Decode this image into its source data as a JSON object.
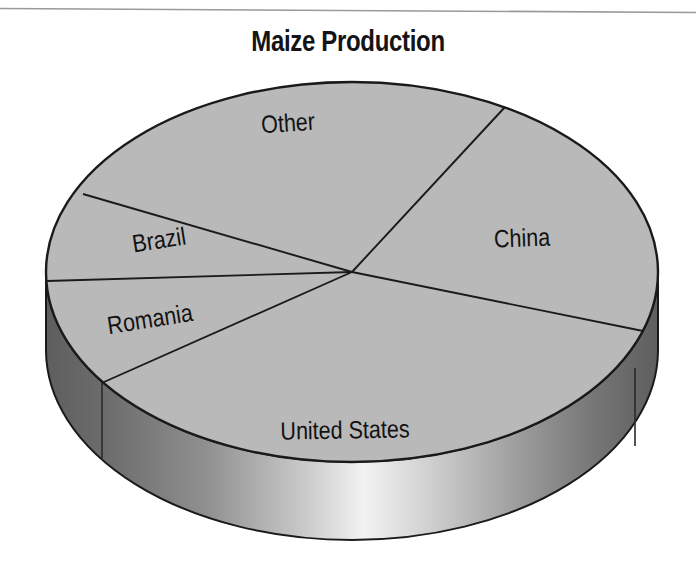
{
  "figure": {
    "title": "Maize Production",
    "background_color": "#ffffff"
  },
  "colors": {
    "top_face": "#b9b9b9",
    "side_wall_dark": "#6b6b6b",
    "side_wall_highlight": "#e8e8e8",
    "outline": "#1a1a1a",
    "label_text": "#121212",
    "title_text": "#141414"
  },
  "chart_data": {
    "type": "pie",
    "title": "Maize Production",
    "subtitle": "",
    "xlabel": "",
    "ylabel": "",
    "three_d": true,
    "legend": "none",
    "labels_position": "inside-slices",
    "categories": [
      "China",
      "United States",
      "Romania",
      "Brazil",
      "Other"
    ],
    "values": [
      21.7,
      37.1,
      7.0,
      7.8,
      26.4
    ],
    "units": "percent of total",
    "slices": [
      {
        "label": "China",
        "value": 21.7,
        "start_angle_deg": 60,
        "end_angle_deg": -18,
        "label_x": 522,
        "label_y": 238,
        "label_rotation_deg": -2
      },
      {
        "label": "United States",
        "value": 37.1,
        "start_angle_deg": -18,
        "end_angle_deg": -155,
        "label_x": 345,
        "label_y": 430,
        "label_rotation_deg": -1
      },
      {
        "label": "Romania",
        "value": 7.0,
        "start_angle_deg": -155,
        "end_angle_deg": 180,
        "label_x": 150,
        "label_y": 319,
        "label_rotation_deg": -9
      },
      {
        "label": "Brazil",
        "value": 7.8,
        "start_angle_deg": 180,
        "end_angle_deg": 164,
        "label_x": 159,
        "label_y": 240,
        "label_rotation_deg": -9
      },
      {
        "label": "Other",
        "value": 26.4,
        "start_angle_deg": 164,
        "end_angle_deg": 60,
        "label_x": 288,
        "label_y": 123,
        "label_rotation_deg": -4
      }
    ]
  }
}
